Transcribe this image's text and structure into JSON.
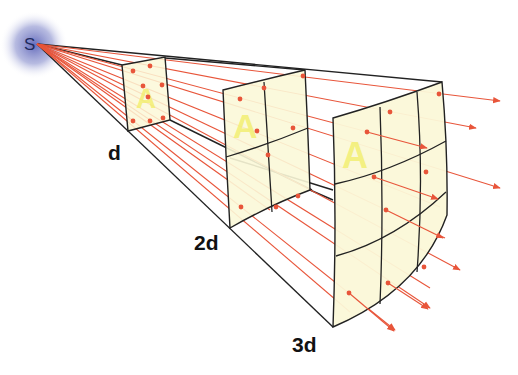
{
  "diagram": {
    "source_label": "S",
    "distance_labels": [
      "d",
      "2d",
      "3d"
    ],
    "area_label": "A",
    "colors": {
      "ray": "#e8553a",
      "panel_fill": "#fbf8d8",
      "outline": "#222222",
      "letter_A": "#f2ee6a",
      "source_glow": "#5a63b8",
      "label": "#111111"
    }
  }
}
